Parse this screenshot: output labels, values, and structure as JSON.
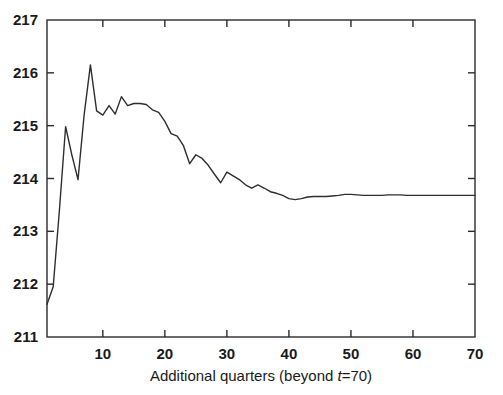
{
  "figure": {
    "background_color": "#ffffff",
    "line_color": "#2e2e2e",
    "axis_color": "#2b2b2b"
  },
  "axes": {
    "x_title_prefix": "Additional quarters (beyond ",
    "x_title_italic": "t",
    "x_title_suffix": "=70)",
    "x_title_full": "Additional quarters (beyond t=70)",
    "y_title": ""
  },
  "chart_data": {
    "type": "line",
    "title": "",
    "subtitle": "",
    "xlabel": "Additional quarters (beyond t=70)",
    "ylabel": "",
    "xlim": [
      1,
      70
    ],
    "ylim": [
      211,
      217
    ],
    "xticks": [
      10,
      20,
      30,
      40,
      50,
      60,
      70
    ],
    "xtick_labels": [
      "10",
      "20",
      "30",
      "40",
      "50",
      "60",
      "70"
    ],
    "yticks": [
      211,
      212,
      213,
      214,
      215,
      216,
      217
    ],
    "ytick_labels": [
      "211",
      "212",
      "213",
      "214",
      "215",
      "216",
      "217"
    ],
    "grid": false,
    "legend": null,
    "legend_position": "none",
    "annotations": [],
    "series": [
      {
        "name": "forecast",
        "x": [
          1,
          2,
          3,
          4,
          5,
          6,
          7,
          8,
          9,
          10,
          11,
          12,
          13,
          14,
          15,
          16,
          17,
          18,
          19,
          20,
          21,
          22,
          23,
          24,
          25,
          26,
          27,
          28,
          29,
          30,
          31,
          32,
          33,
          34,
          35,
          36,
          37,
          38,
          39,
          40,
          41,
          42,
          43,
          44,
          45,
          46,
          47,
          48,
          49,
          50,
          51,
          52,
          53,
          54,
          55,
          56,
          57,
          58,
          59,
          60,
          61,
          62,
          63,
          64,
          65,
          66,
          67,
          68,
          69,
          70
        ],
        "y": [
          211.62,
          211.95,
          213.4,
          214.98,
          214.45,
          213.98,
          215.22,
          216.15,
          215.28,
          215.2,
          215.38,
          215.22,
          215.55,
          215.38,
          215.42,
          215.42,
          215.4,
          215.3,
          215.25,
          215.08,
          214.85,
          214.8,
          214.62,
          214.28,
          214.45,
          214.38,
          214.25,
          214.08,
          213.92,
          214.12,
          214.05,
          213.98,
          213.88,
          213.82,
          213.88,
          213.82,
          213.75,
          213.72,
          213.68,
          213.62,
          213.6,
          213.62,
          213.65,
          213.66,
          213.66,
          213.66,
          213.67,
          213.68,
          213.7,
          213.7,
          213.69,
          213.68,
          213.68,
          213.68,
          213.68,
          213.69,
          213.69,
          213.69,
          213.68,
          213.68,
          213.68,
          213.68,
          213.68,
          213.68,
          213.68,
          213.68,
          213.68,
          213.68,
          213.68,
          213.68
        ]
      }
    ]
  }
}
